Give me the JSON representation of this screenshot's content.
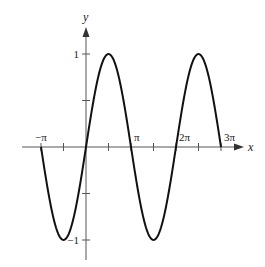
{
  "chart_data": {
    "type": "line",
    "title": "",
    "function": "y = sin(x)",
    "xlabel": "x",
    "ylabel": "y",
    "xlim_pi": [
      -1.0,
      3.0
    ],
    "ylim": [
      -1,
      1
    ],
    "grid": false,
    "x_ticks": [
      {
        "value_pi": -1.0,
        "label": "−π"
      },
      {
        "value_pi": -0.5,
        "label": ""
      },
      {
        "value_pi": 0.5,
        "label": ""
      },
      {
        "value_pi": 1.0,
        "label": "π"
      },
      {
        "value_pi": 1.5,
        "label": ""
      },
      {
        "value_pi": 2.0,
        "label": "2π"
      },
      {
        "value_pi": 2.5,
        "label": ""
      },
      {
        "value_pi": 3.0,
        "label": "3π"
      }
    ],
    "y_ticks": [
      {
        "value": 1,
        "label": "1"
      },
      {
        "value": 0.5,
        "label": ""
      },
      {
        "value": -0.5,
        "label": ""
      },
      {
        "value": -1,
        "label": "−1"
      }
    ],
    "series": [
      {
        "name": "sin(x)",
        "x_pi": [
          -1.0,
          -0.5,
          0.0,
          0.5,
          1.0,
          1.5,
          2.0,
          2.5,
          3.0
        ],
        "y": [
          0,
          -1,
          0,
          1,
          0,
          -1,
          0,
          1,
          0
        ]
      }
    ]
  }
}
